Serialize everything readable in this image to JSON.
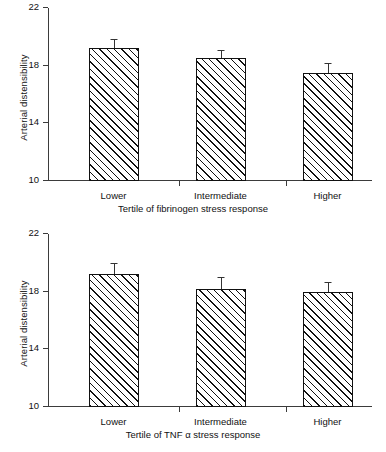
{
  "figure": {
    "width": 386,
    "height": 452,
    "background": "#ffffff",
    "ink_color": "#111111"
  },
  "chart_data": [
    {
      "type": "bar",
      "panel": "top",
      "title": "",
      "xlabel": "Tertile of fibrinogen stress response",
      "ylabel": "Arterial distensibility",
      "categories": [
        "Lower",
        "Intermediate",
        "Higher"
      ],
      "values": [
        19.2,
        18.5,
        17.5
      ],
      "errors": [
        0.55,
        0.55,
        0.65
      ],
      "yticks": [
        10,
        14,
        18,
        22
      ],
      "ytick_labels": [
        "10",
        "14",
        "18",
        "22"
      ],
      "ylim": [
        10,
        22
      ],
      "grid": false,
      "legend": "none",
      "bar_fill": "diagonal-hatch",
      "error_bar_style": "upper-only-with-cap"
    },
    {
      "type": "bar",
      "panel": "bottom",
      "title": "",
      "xlabel": "Tertile of TNF α stress response",
      "ylabel": "Arterial distensibility",
      "categories": [
        "Lower",
        "Intermediate",
        "Higher"
      ],
      "values": [
        19.2,
        18.2,
        18.0
      ],
      "errors": [
        0.75,
        0.75,
        0.6
      ],
      "yticks": [
        10,
        14,
        18,
        22
      ],
      "ytick_labels": [
        "10",
        "14",
        "18",
        "22"
      ],
      "ylim": [
        10,
        22
      ],
      "grid": false,
      "legend": "none",
      "bar_fill": "diagonal-hatch",
      "error_bar_style": "upper-only-with-cap"
    }
  ]
}
